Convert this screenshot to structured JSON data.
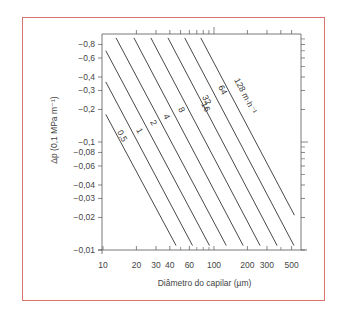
{
  "chart_data": {
    "type": "line",
    "title": "",
    "xlabel": "Diâmetro do capilar (µm)",
    "ylabel": "Δp (0,1 MPa m⁻¹)",
    "xscale": "log",
    "yscale": "log",
    "xlim": [
      10,
      550
    ],
    "ylim": [
      -0.01,
      -1.0
    ],
    "grid": false,
    "legend": "inline labels on lines",
    "x_ticks": [
      10,
      20,
      30,
      40,
      60,
      100,
      200,
      300,
      500
    ],
    "x_tick_labels": [
      "10",
      "20",
      "30",
      "40",
      "60",
      "100",
      "200",
      "300",
      "500"
    ],
    "y_ticks": [
      -0.8,
      -0.6,
      -0.4,
      -0.3,
      -0.2,
      -0.1,
      -0.08,
      -0.06,
      -0.04,
      -0.03,
      -0.02,
      -0.01
    ],
    "y_tick_labels": [
      "−0,8",
      "−0,6",
      "−0,4",
      "−0,3",
      "−0,2",
      "−0,1",
      "−0,08",
      "−0,06",
      "−0,04",
      "−0,03",
      "−0,02",
      "−0,01"
    ],
    "series": [
      {
        "name": "0,5",
        "label": "0,5",
        "x": [
          10.6,
          45.5
        ],
        "y": [
          -0.18,
          -0.011
        ]
      },
      {
        "name": "1",
        "label": "1",
        "x": [
          10.6,
          64
        ],
        "y": [
          -0.36,
          -0.011
        ]
      },
      {
        "name": "2",
        "label": "2",
        "x": [
          10.6,
          91
        ],
        "y": [
          -0.7,
          -0.011
        ]
      },
      {
        "name": "4",
        "label": "4",
        "x": [
          13.1,
          129
        ],
        "y": [
          -0.92,
          -0.011
        ]
      },
      {
        "name": "8",
        "label": "8",
        "x": [
          19.0,
          183
        ],
        "y": [
          -0.92,
          -0.011
        ]
      },
      {
        "name": "16",
        "label": "16",
        "x": [
          27.0,
          260
        ],
        "y": [
          -0.92,
          -0.011
        ]
      },
      {
        "name": "32",
        "label": "32",
        "x": [
          38.5,
          370
        ],
        "y": [
          -0.92,
          -0.011
        ]
      },
      {
        "name": "64",
        "label": "64",
        "x": [
          54.5,
          525
        ],
        "y": [
          -0.92,
          -0.011
        ]
      },
      {
        "name": "128 m·h⁻¹",
        "label": "128 m·h⁻¹",
        "x": [
          76,
          530
        ],
        "y": [
          -0.92,
          -0.021
        ]
      }
    ]
  },
  "axes": {
    "xlabel": "Diâmetro do capilar (µm)",
    "ylabel": "Δp (0,1 MPa m⁻¹)"
  },
  "colors": {
    "frame_border": "#d9756f",
    "axis": "#555555",
    "lines": "#333333"
  }
}
